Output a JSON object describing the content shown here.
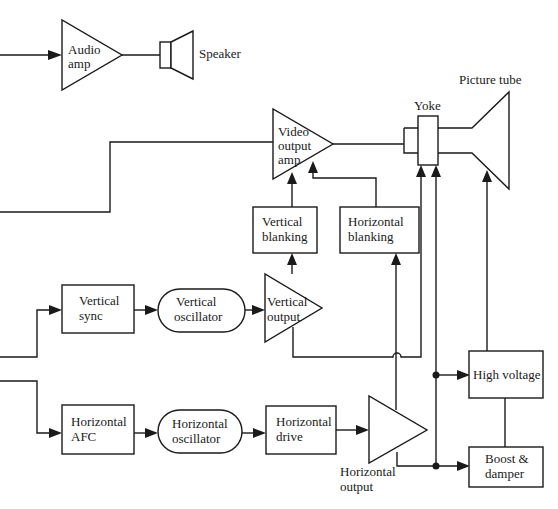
{
  "diagram": {
    "blocks": {
      "audio_amp": {
        "line1": "Audio",
        "line2": "amp"
      },
      "speaker": {
        "label": "Speaker"
      },
      "picture_tube": {
        "label": "Picture tube"
      },
      "yoke": {
        "label": "Yoke"
      },
      "video_output_amp": {
        "line1": "Video",
        "line2": "output",
        "line3": "amp"
      },
      "vertical_blanking": {
        "line1": "Vertical",
        "line2": "blanking"
      },
      "horizontal_blanking": {
        "line1": "Horizontal",
        "line2": "blanking"
      },
      "vertical_sync": {
        "line1": "Vertical",
        "line2": "sync"
      },
      "vertical_oscillator": {
        "line1": "Vertical",
        "line2": "oscillator"
      },
      "vertical_output": {
        "line1": "Vertical",
        "line2": "output"
      },
      "horizontal_afc": {
        "line1": "Horizontal",
        "line2": "AFC"
      },
      "horizontal_oscillator": {
        "line1": "Horizontal",
        "line2": "oscillator"
      },
      "horizontal_drive": {
        "line1": "Horizontal",
        "line2": "drive"
      },
      "horizontal_output": {
        "line1": "Horizontal",
        "line2": "output"
      },
      "high_voltage": {
        "label": "High voltage"
      },
      "boost_damper": {
        "line1": "Boost &",
        "line2": "damper"
      }
    },
    "connections": [
      {
        "from": "audio input",
        "to": "Audio amp"
      },
      {
        "from": "Audio amp",
        "to": "Speaker"
      },
      {
        "from": "video input",
        "to": "Video output amp"
      },
      {
        "from": "Video output amp",
        "to": "Picture tube"
      },
      {
        "from": "Vertical blanking",
        "to": "Video output amp"
      },
      {
        "from": "Horizontal blanking",
        "to": "Video output amp"
      },
      {
        "from": "sync input",
        "to": "Vertical sync"
      },
      {
        "from": "Vertical sync",
        "to": "Vertical oscillator"
      },
      {
        "from": "Vertical oscillator",
        "to": "Vertical output"
      },
      {
        "from": "Vertical output",
        "to": "Vertical blanking"
      },
      {
        "from": "Vertical output",
        "to": "Yoke"
      },
      {
        "from": "sync input",
        "to": "Horizontal AFC"
      },
      {
        "from": "Horizontal AFC",
        "to": "Horizontal oscillator"
      },
      {
        "from": "Horizontal oscillator",
        "to": "Horizontal drive"
      },
      {
        "from": "Horizontal drive",
        "to": "Horizontal output"
      },
      {
        "from": "Horizontal output",
        "to": "Horizontal blanking"
      },
      {
        "from": "Horizontal output",
        "to": "Boost & damper"
      },
      {
        "from": "Horizontal output",
        "to": "High voltage"
      },
      {
        "from": "Horizontal output",
        "to": "Yoke"
      },
      {
        "from": "High voltage",
        "to": "Picture tube"
      },
      {
        "from": "High voltage",
        "to": "Boost & damper"
      }
    ]
  }
}
